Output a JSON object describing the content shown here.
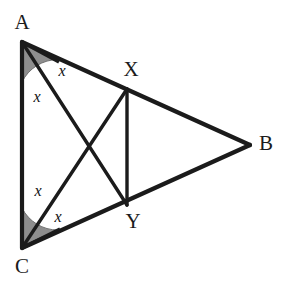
{
  "figure": {
    "canvas": {
      "width": 284,
      "height": 286,
      "background": "#ffffff"
    },
    "style": {
      "stroke_color": "#1b1b1b",
      "side_stroke_width": 4.2,
      "cevian_stroke_width": 3.4,
      "sector_fill": "#8e8e8e",
      "sector_stroke": "#6f6f6f",
      "label_color": "#1b1b1b"
    },
    "vertices": [
      {
        "name": "A",
        "label": "A",
        "x": 22,
        "y": 42,
        "label_x": 22,
        "label_y": 24
      },
      {
        "name": "B",
        "label": "B",
        "x": 250,
        "y": 145,
        "label_x": 266,
        "label_y": 145
      },
      {
        "name": "C",
        "label": "C",
        "x": 22,
        "y": 248,
        "label_x": 22,
        "label_y": 268
      }
    ],
    "points": [
      {
        "name": "X",
        "label": "X",
        "x": 127,
        "y": 89,
        "on_segment": "AB",
        "label_x": 131,
        "label_y": 71
      },
      {
        "name": "Y",
        "label": "Y",
        "x": 127,
        "y": 205,
        "on_segment": "CB",
        "label_x": 133,
        "label_y": 223
      }
    ],
    "intersection": {
      "name": "P",
      "x": 91,
      "y": 147
    },
    "sides": [
      {
        "name": "side-AB",
        "from": "A",
        "to": "B"
      },
      {
        "name": "side-BC",
        "from": "B",
        "to": "C"
      },
      {
        "name": "side-CA",
        "from": "C",
        "to": "A"
      }
    ],
    "cevians": [
      {
        "name": "cevian-AY",
        "from": "A",
        "to": "Y"
      },
      {
        "name": "cevian-CX",
        "from": "C",
        "to": "X"
      },
      {
        "name": "segment-XY",
        "from": "X",
        "to": "Y"
      }
    ],
    "sectors": [
      {
        "name": "angle-sector-A",
        "vertex": "A",
        "radius": 40,
        "path": "M 22 42 L 22 82 A 40 40 0 0 1 58 59.6 Z",
        "divider": {
          "x1": 22,
          "y1": 42,
          "x2": 59,
          "y2": 62
        }
      },
      {
        "name": "angle-sector-C",
        "vertex": "C",
        "radius": 40,
        "path": "M 22 248 L 22 208 A 40 40 0 0 0 58 230 Z",
        "divider": {
          "x1": 22,
          "y1": 248,
          "x2": 60,
          "y2": 229
        }
      }
    ],
    "angle_labels": [
      {
        "name": "angle-label-a-upper",
        "text": "x",
        "x": 62,
        "y": 72
      },
      {
        "name": "angle-label-a-lower",
        "text": "x",
        "x": 37,
        "y": 98
      },
      {
        "name": "angle-label-c-upper",
        "text": "x",
        "x": 38,
        "y": 192
      },
      {
        "name": "angle-label-c-lower",
        "text": "x",
        "x": 58,
        "y": 218
      }
    ]
  }
}
